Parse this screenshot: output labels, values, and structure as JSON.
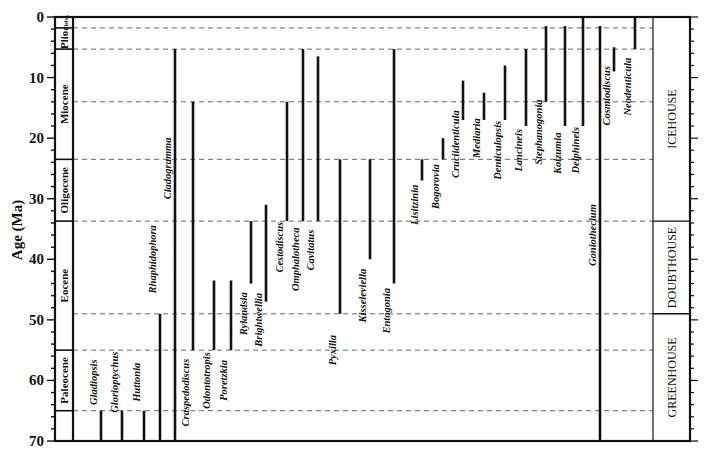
{
  "chart_data": {
    "type": "range-chart",
    "title": "",
    "ylabel": "Age (Ma)",
    "xlabel": "",
    "ylim": [
      0,
      70
    ],
    "y_inverted": true,
    "y_ticks": [
      0,
      10,
      20,
      30,
      40,
      50,
      60,
      70
    ],
    "grid": "dashed lines at epoch boundaries",
    "epoch_boundaries_ma": [
      1.8,
      5.3,
      14,
      23.5,
      33.7,
      49,
      55,
      65
    ],
    "epochs": [
      {
        "name": "Pleist.",
        "start": 0,
        "end": 1.8
      },
      {
        "name": "Plio.",
        "start": 1.8,
        "end": 5.3
      },
      {
        "name": "Miocene",
        "start": 5.3,
        "end": 23.5
      },
      {
        "name": "Oligocene",
        "start": 23.5,
        "end": 33.7
      },
      {
        "name": "Eocene",
        "start": 33.7,
        "end": 55
      },
      {
        "name": "Paleocene",
        "start": 55,
        "end": 65
      }
    ],
    "climate_zones": [
      {
        "name": "ICEHOUSE",
        "start": 0,
        "end": 33.7
      },
      {
        "name": "DOUBTHOUSE",
        "start": 33.7,
        "end": 49
      },
      {
        "name": "GREENHOUSE",
        "start": 49,
        "end": 70
      }
    ],
    "series": [
      {
        "name": "Gladiopsis",
        "top": 65,
        "bottom": 70
      },
      {
        "name": "Glorioptychus",
        "top": 65,
        "bottom": 70
      },
      {
        "name": "Huttonia",
        "top": 65,
        "bottom": 70
      },
      {
        "name": "Rhaphidophora",
        "top": 49,
        "bottom": 70
      },
      {
        "name": "Cladogramma",
        "top": 5.3,
        "bottom": 70
      },
      {
        "name": "Craspedodiscus",
        "top": 14,
        "bottom": 55
      },
      {
        "name": "Odontotropis",
        "top": 43.5,
        "bottom": 55
      },
      {
        "name": "Poretzkia",
        "top": 43.5,
        "bottom": 55
      },
      {
        "name": "Rylandsia",
        "top": 33.7,
        "bottom": 44
      },
      {
        "name": "Brightwellia",
        "top": 31,
        "bottom": 47
      },
      {
        "name": "Cestodiscus",
        "top": 14,
        "bottom": 33.7
      },
      {
        "name": "Omphalotheca",
        "top": 5.3,
        "bottom": 33.7
      },
      {
        "name": "Cavitatus",
        "top": 6.5,
        "bottom": 33.7
      },
      {
        "name": "Pyxilla",
        "top": 23.5,
        "bottom": 49
      },
      {
        "name": "Kisseleviella",
        "top": 23.5,
        "bottom": 40
      },
      {
        "name": "Entogonia",
        "top": 5.3,
        "bottom": 44
      },
      {
        "name": "Lisitzinia",
        "top": 23.5,
        "bottom": 27
      },
      {
        "name": "Bogorovia",
        "top": 20,
        "bottom": 23.5
      },
      {
        "name": "Cruciidenticula",
        "top": 10.5,
        "bottom": 17
      },
      {
        "name": "Mediaria",
        "top": 12.5,
        "bottom": 17
      },
      {
        "name": "Denticulopsis",
        "top": 8,
        "bottom": 17
      },
      {
        "name": "Lancineis",
        "top": 5.3,
        "bottom": 18
      },
      {
        "name": "Stephanogonia",
        "top": 1.5,
        "bottom": 14
      },
      {
        "name": "Koizumia",
        "top": 1.5,
        "bottom": 18
      },
      {
        "name": "Delphineis",
        "top": 0,
        "bottom": 18
      },
      {
        "name": "Goniothecium",
        "top": 1.5,
        "bottom": 70
      },
      {
        "name": "Cosmiodiscus",
        "top": 5,
        "bottom": 9
      },
      {
        "name": "Neodenticula",
        "top": 0,
        "bottom": 5.3
      }
    ]
  }
}
